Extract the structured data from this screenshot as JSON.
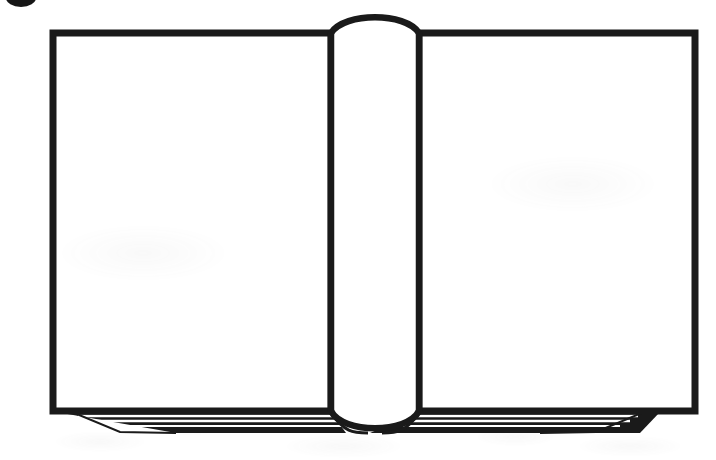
{
  "image": {
    "title": "Open Book",
    "description": "Black and white line drawing of an open book with blank facing pages",
    "width": 716,
    "height": 460,
    "background_color": "#ffffff",
    "ink_color": "#1a1a1a",
    "page_fill_color": "#ffffff",
    "style": "line-art"
  },
  "corner_mark": {
    "name": "corner-dot",
    "shape": "ellipse",
    "color": "#161616",
    "cx": 21,
    "cy": -2,
    "rx": 15,
    "ry": 9,
    "clipped": "top-left image edge"
  },
  "book": {
    "left_page": {
      "label": "Left Page",
      "x": 53,
      "y": 33,
      "width": 278,
      "height": 378,
      "blank": true
    },
    "right_page": {
      "label": "Right Page",
      "x": 419,
      "y": 33,
      "width": 276,
      "height": 378,
      "blank": true
    },
    "spine": {
      "label": "Spine",
      "left_x": 331,
      "right_x": 419,
      "top_y": 33,
      "bottom_y": 411,
      "top_arch_peak_y": 15,
      "bottom_arch_dip_y": 430
    },
    "page_stack_left": {
      "label": "Left Page Edges",
      "lines": 4,
      "top_y": 413,
      "bottom_y": 434
    },
    "page_stack_right": {
      "label": "Right Page Edges",
      "lines": 4,
      "top_y": 413,
      "bottom_y": 434
    }
  },
  "geometry": {
    "stroke_width_outline": 7,
    "stroke_width_spine": 6,
    "stroke_width_pagelines": 2
  }
}
